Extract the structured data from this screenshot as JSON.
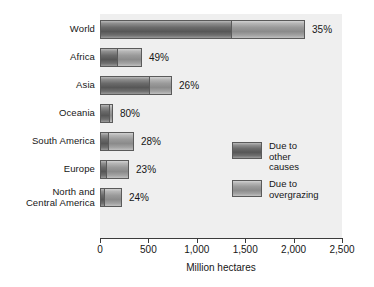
{
  "chart_data": {
    "type": "bar",
    "orientation": "horizontal",
    "stacked": true,
    "title": "",
    "subtitle": "",
    "xlabel": "Million hectares",
    "ylabel": "",
    "xlim": [
      0,
      2500
    ],
    "grid": false,
    "legend_position": "inside-right",
    "xticks": [
      0,
      500,
      1000,
      1500,
      2000,
      2500
    ],
    "xtick_labels": [
      "0",
      "500",
      "1,000",
      "1,500",
      "2,000",
      "2,500"
    ],
    "categories": [
      "World",
      "Africa",
      "Asia",
      "Oceania",
      "South America",
      "Europe",
      "North and\nCentral America"
    ],
    "series": [
      {
        "name": "Due to overgrazing",
        "values": [
          1363,
          186,
          517,
          107,
          98,
          69,
          54
        ]
      },
      {
        "name": "Due to other causes",
        "values": [
          755,
          248,
          227,
          27,
          253,
          231,
          173
        ]
      }
    ],
    "totals": [
      2118,
      434,
      744,
      134,
      351,
      300,
      227
    ],
    "data_labels": [
      "35%",
      "49%",
      "26%",
      "80%",
      "28%",
      "23%",
      "24%"
    ],
    "data_label_note": "percent share shown at end of each bar",
    "colors": {
      "segment_overgrazing": "#6a6a6a",
      "segment_other_causes": "#9a9a9a",
      "plot_background": "#efefef",
      "axis": "#3c3c3c",
      "text": "#161616"
    }
  },
  "legend": {
    "items": [
      {
        "label": "Due to\nother causes",
        "swatch": "dark"
      },
      {
        "label": "Due to\novergrazing",
        "swatch": "light"
      }
    ]
  },
  "axis": {
    "x_title": "Million hectares"
  }
}
